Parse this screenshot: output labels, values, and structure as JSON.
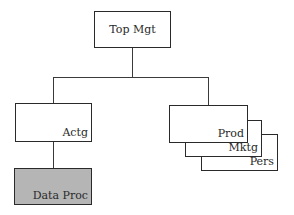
{
  "diagram": {
    "type": "organization-chart",
    "nodes": [
      {
        "id": "top",
        "label": "Top Mgt",
        "x": 94,
        "y": 11,
        "w": 77,
        "h": 37,
        "fill": "#ffffff",
        "label_pos": "center"
      },
      {
        "id": "actg",
        "label": "Actg",
        "x": 15,
        "y": 103,
        "w": 77,
        "h": 39,
        "fill": "#ffffff",
        "label_pos": "bottom-right"
      },
      {
        "id": "dataproc",
        "label": "Data Proc",
        "x": 14,
        "y": 168,
        "w": 78,
        "h": 37,
        "fill": "#b5b5b5",
        "label_pos": "bottom-right"
      },
      {
        "id": "pers",
        "label": "Pers",
        "x": 201,
        "y": 134,
        "w": 77,
        "h": 37,
        "fill": "#ffffff",
        "label_pos": "bottom-right"
      },
      {
        "id": "mktg",
        "label": "Mktg",
        "x": 185,
        "y": 120,
        "w": 77,
        "h": 37,
        "fill": "#ffffff",
        "label_pos": "bottom-right"
      },
      {
        "id": "prod",
        "label": "Prod",
        "x": 169,
        "y": 105,
        "w": 79,
        "h": 38,
        "fill": "#ffffff",
        "label_pos": "bottom-right"
      }
    ],
    "edges": [
      {
        "from": "top",
        "to": "actg"
      },
      {
        "from": "top",
        "to": "prod"
      },
      {
        "from": "actg",
        "to": "dataproc"
      }
    ],
    "stacked_group": [
      "prod",
      "mktg",
      "pers"
    ],
    "colors": {
      "line": "#2a2a2a",
      "highlight_fill": "#b5b5b5",
      "background": "#ffffff"
    }
  }
}
